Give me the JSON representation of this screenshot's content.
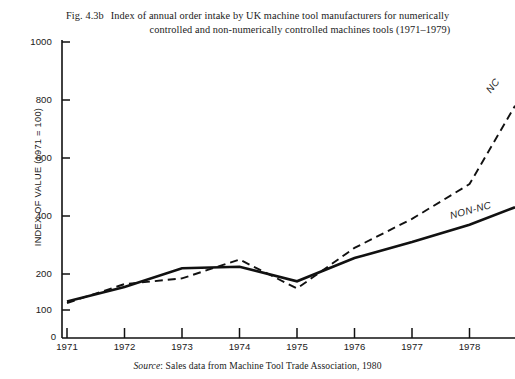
{
  "figure": {
    "number": "Fig. 4.3b",
    "title_line1": "Index of annual order intake by UK machine tool manufacturers for numerically",
    "title_line2": "controlled and non-numerically controlled machines tools (1971–1979)",
    "source_prefix": "Source",
    "source_text": ": Sales data from Machine Tool Trade Association, 1980"
  },
  "axes": {
    "y_title": "INDEX OF VALUE (1971 = 100)",
    "origin_label": "0",
    "y_ticks": [
      "1000",
      "800",
      "600",
      "400",
      "200",
      "100"
    ],
    "x_ticks": [
      "1971",
      "1972",
      "1973",
      "1974",
      "1975",
      "1976",
      "1977",
      "1978"
    ]
  },
  "series_tags": {
    "nc": "NC",
    "non_nc": "NON-NC"
  },
  "chart_data": {
    "type": "line",
    "title": "Index of annual order intake by UK machine tool manufacturers for numerically controlled and non-numerically controlled machines tools (1971–1979)",
    "xlabel": "",
    "ylabel": "INDEX OF VALUE (1971 = 100)",
    "xlim": [
      1971,
      1979
    ],
    "ylim": [
      0,
      1000
    ],
    "yticks": [
      100,
      200,
      400,
      600,
      800,
      1000
    ],
    "xticks": [
      1971,
      1972,
      1973,
      1974,
      1975,
      1976,
      1977,
      1978
    ],
    "grid": false,
    "legend": "inline end-of-line labels",
    "x": [
      1971,
      1972,
      1973,
      1974,
      1975,
      1976,
      1977,
      1978,
      1979
    ],
    "series": [
      {
        "name": "NC",
        "style": "dashed",
        "color": "#111111",
        "values": [
          100,
          165,
          185,
          250,
          150,
          290,
          390,
          510,
          780
        ]
      },
      {
        "name": "NON-NC",
        "style": "solid",
        "color": "#111111",
        "values": [
          105,
          155,
          220,
          225,
          175,
          255,
          310,
          370,
          430
        ]
      }
    ],
    "annotations": [
      {
        "text": "NC",
        "at_x": 1979,
        "at_y": 780,
        "note": "label clipped at right plot edge"
      },
      {
        "text": "NON-NC",
        "at_x": 1979,
        "at_y": 430,
        "note": "label clipped at right plot edge"
      }
    ],
    "source": "Sales data from Machine Tool Trade Association, 1980"
  },
  "geometry": {
    "x_px": [
      67,
      124.5,
      182,
      239.5,
      297,
      354.5,
      412,
      469.5,
      515
    ],
    "y_map": {
      "v1000": 42,
      "v800": 100,
      "v600": 158,
      "v400": 216,
      "v200": 274,
      "v100": 310,
      "v0": 338
    }
  }
}
